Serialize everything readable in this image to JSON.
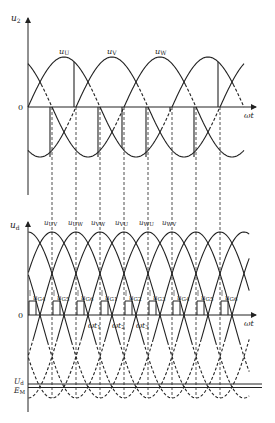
{
  "figure": {
    "top_plot": {
      "y_axis_label": "u",
      "y_axis_sub": "2",
      "x_axis_label": "ωt",
      "origin_label": "0",
      "phase_labels": [
        {
          "main": "u",
          "sub": "U"
        },
        {
          "main": "u",
          "sub": "V"
        },
        {
          "main": "u",
          "sub": "W"
        }
      ]
    },
    "bottom_plot": {
      "y_axis_label": "u",
      "y_axis_sub": "d",
      "x_axis_label": "ωt",
      "origin_label": "0",
      "line_voltage_labels": [
        {
          "main": "u",
          "sub": "UV"
        },
        {
          "main": "u",
          "sub": "UW"
        },
        {
          "main": "u",
          "sub": "VW"
        },
        {
          "main": "u",
          "sub": "VU"
        },
        {
          "main": "u",
          "sub": "WU"
        },
        {
          "main": "u",
          "sub": "WV"
        }
      ],
      "gate_pulse_labels": [
        {
          "main": "u",
          "sub": "G4"
        },
        {
          "main": "u",
          "sub": "G5"
        },
        {
          "main": "u",
          "sub": "G6"
        },
        {
          "main": "u",
          "sub": "G1"
        },
        {
          "main": "u",
          "sub": "G2"
        },
        {
          "main": "u",
          "sub": "G3"
        },
        {
          "main": "u",
          "sub": "G4"
        },
        {
          "main": "u",
          "sub": "G5"
        },
        {
          "main": "u",
          "sub": "G6"
        }
      ],
      "time_labels": [
        {
          "main": "ωt",
          "sub": "1"
        },
        {
          "main": "ωt",
          "sub": "2"
        },
        {
          "main": "ωt",
          "sub": "3"
        }
      ],
      "level_labels": [
        {
          "main": "U",
          "sub": "d"
        },
        {
          "main": "E",
          "sub": "M"
        }
      ]
    },
    "colors": {
      "ink": "#222222",
      "background": "#ffffff"
    }
  }
}
